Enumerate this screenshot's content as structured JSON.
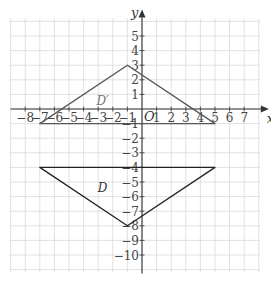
{
  "chart_data": {
    "type": "scatter",
    "title": "",
    "xlabel": "x",
    "ylabel": "y",
    "origin_label": "O",
    "xlim": [
      -9,
      8
    ],
    "ylim": [
      -11,
      6
    ],
    "grid": true,
    "x_ticks": [
      -8,
      -7,
      -6,
      -5,
      -4,
      -3,
      -2,
      -1,
      1,
      2,
      3,
      4,
      5,
      6,
      7
    ],
    "y_ticks": [
      5,
      4,
      3,
      2,
      1,
      -1,
      -2,
      -3,
      -4,
      -5,
      -6,
      -7,
      -8,
      -9,
      -10
    ],
    "shapes": [
      {
        "name": "D",
        "label": "D",
        "vertices": [
          [
            -7,
            -4
          ],
          [
            5,
            -4
          ],
          [
            -1,
            -8
          ]
        ],
        "label_pos": [
          -2.7,
          -5.7
        ]
      },
      {
        "name": "D'",
        "label": "D′",
        "vertices": [
          [
            -7,
            -1
          ],
          [
            5,
            -1
          ],
          [
            -1,
            3
          ]
        ],
        "label_pos": [
          -2.7,
          0.25
        ]
      }
    ]
  }
}
